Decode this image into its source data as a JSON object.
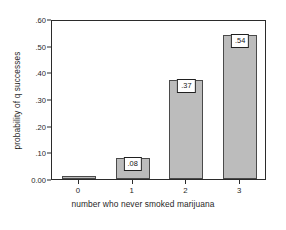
{
  "chart_data": {
    "type": "bar",
    "title": "",
    "subtitle": "",
    "xlabel": "number who never smoked marijuana",
    "ylabel": "probability of q successes",
    "categories": [
      "0",
      "1",
      "2",
      "3"
    ],
    "values": [
      0.01,
      0.08,
      0.37,
      0.54
    ],
    "data_labels": [
      "",
      ".08",
      ".37",
      ".54"
    ],
    "ylim": [
      0.0,
      0.6
    ],
    "yticks": [
      0.0,
      0.1,
      0.2,
      0.3,
      0.4,
      0.5,
      0.6
    ],
    "ytick_labels": [
      "0.00",
      ".10",
      ".20",
      ".30",
      ".40",
      ".50",
      ".60"
    ],
    "xtick_labels": [
      "0",
      "1",
      "2",
      "3"
    ],
    "grid": false,
    "legend": false,
    "legend_position": "none",
    "bar_fill_color": "#bcbcbc",
    "bar_edge_color": "#4a4a4a",
    "axis_color": "#2b2b2b",
    "background_color": "#ffffff",
    "label_box_fill": "#ffffff",
    "label_box_border": "#202020"
  }
}
